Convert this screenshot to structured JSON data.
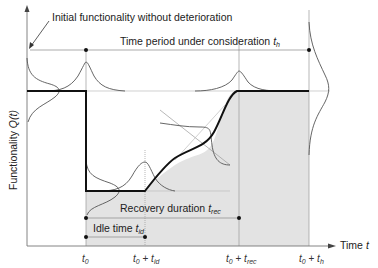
{
  "diagram": {
    "type": "resilience-functionality-curve",
    "y_axis_label_prefix": "Functionality ",
    "y_axis_label_var": "Q(t)",
    "x_axis_label_prefix": "Time ",
    "x_axis_label_var": "t",
    "annotations": {
      "initial": "Initial functionality without deterioration",
      "period_prefix": "Time period under consideration ",
      "period_var": "t",
      "period_sub": "h",
      "recovery_prefix": "Recovery duration ",
      "recovery_var": "t",
      "recovery_sub": "rec",
      "idle_prefix": "Idle time ",
      "idle_var": "t",
      "idle_sub": "id"
    },
    "ticks": [
      {
        "main": "t",
        "sub": "0",
        "plus": "",
        "var2": "",
        "sub2": ""
      },
      {
        "main": "t",
        "sub": "0",
        "plus": " + ",
        "var2": "t",
        "sub2": "id"
      },
      {
        "main": "t",
        "sub": "0",
        "plus": " + ",
        "var2": "t",
        "sub2": "rec"
      },
      {
        "main": "t",
        "sub": "0",
        "plus": " + ",
        "var2": "t",
        "sub2": "h"
      }
    ],
    "colors": {
      "curve": "#111111",
      "distribution": "#555555",
      "shading": "#e2e2e2",
      "guide": "#aaaaaa"
    }
  }
}
